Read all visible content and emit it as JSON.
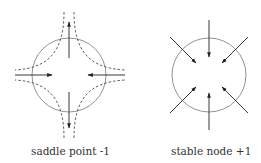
{
  "diagrams": [
    {
      "id": "saddle",
      "label": "saddle point -1",
      "type": "saddle point",
      "index": -1
    },
    {
      "id": "stable",
      "label": "stable node +1",
      "type": "stable node",
      "index": 1
    }
  ],
  "colors": {
    "stroke": "#333333",
    "circle": "#777777"
  }
}
